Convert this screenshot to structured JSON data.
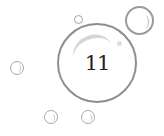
{
  "game": {
    "main_bubble": {
      "value": "11"
    },
    "colors": {
      "background": "#ffffff",
      "bubble_outline": "#8e8e8e",
      "text": "#222222"
    },
    "decorative_bubbles": [
      {
        "name": "top-right",
        "cx": 139,
        "cy": 20,
        "r": 14
      },
      {
        "name": "small-top",
        "cx": 78,
        "cy": 19,
        "r": 4
      },
      {
        "name": "left",
        "cx": 17,
        "cy": 68,
        "r": 7
      },
      {
        "name": "bottom-left",
        "cx": 51,
        "cy": 117,
        "r": 7
      },
      {
        "name": "bottom-right",
        "cx": 88,
        "cy": 117,
        "r": 7
      }
    ]
  }
}
